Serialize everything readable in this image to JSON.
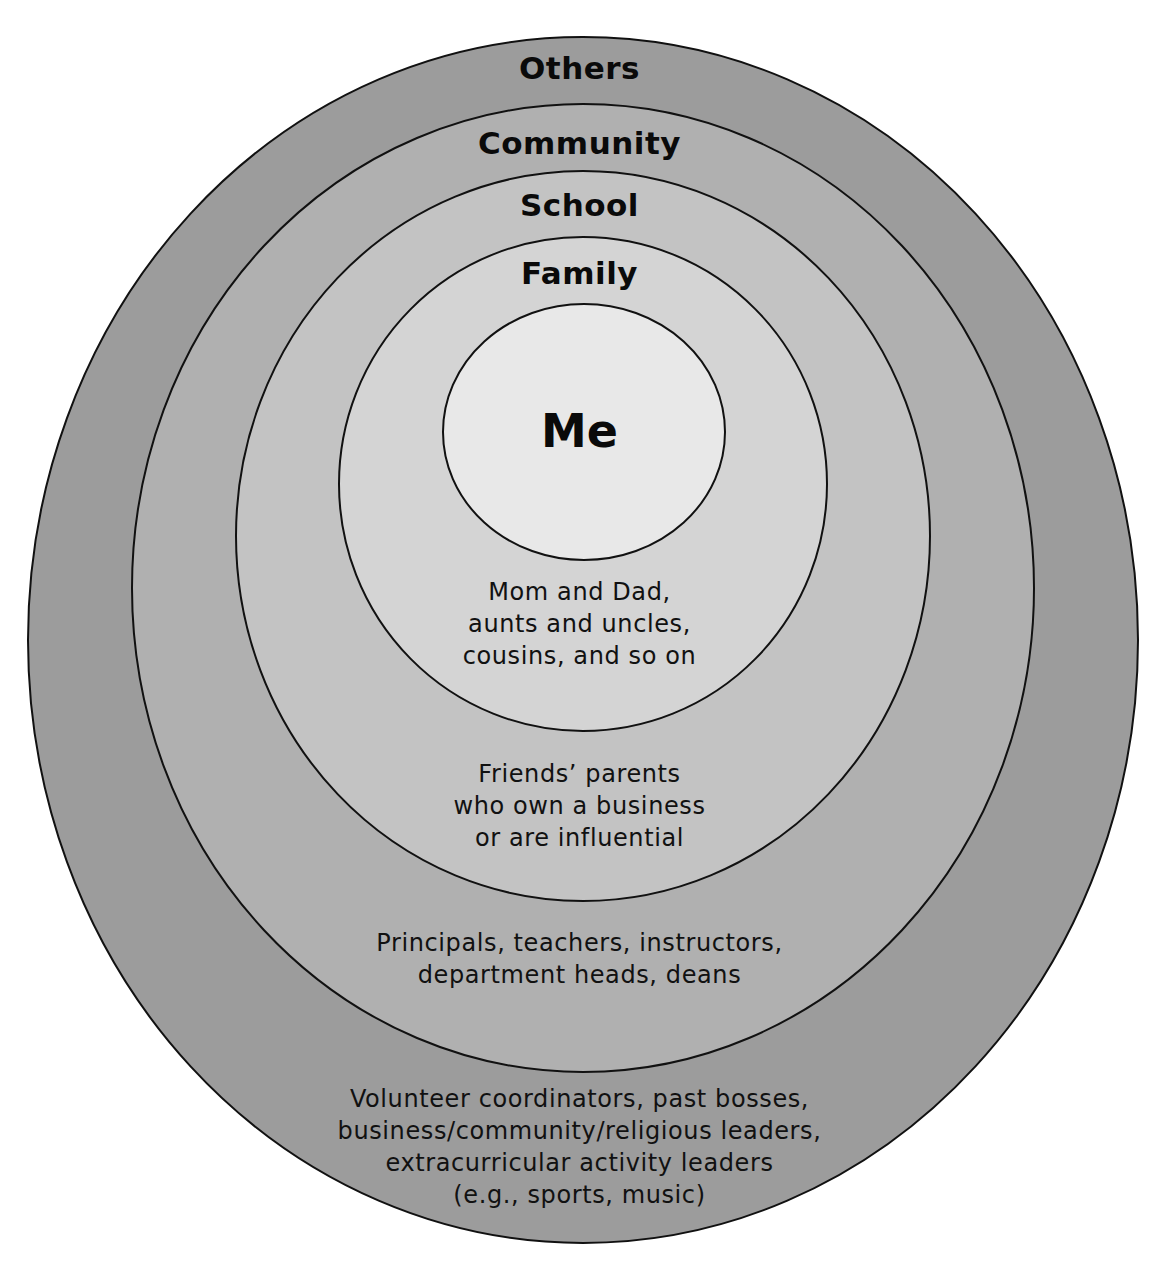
{
  "diagram": {
    "type": "concentric-circles",
    "rings": [
      {
        "id": "others",
        "title": "Others",
        "fill": "#9c9c9c",
        "description": [
          "Volunteer coordinators, past bosses,",
          "business/community/religious leaders,",
          "extracurricular activity leaders",
          "(e.g., sports, music)"
        ]
      },
      {
        "id": "community",
        "title": "Community",
        "fill": "#b0b0b0",
        "description": [
          "Principals, teachers, instructors,",
          "department heads, deans"
        ]
      },
      {
        "id": "school",
        "title": "School",
        "fill": "#c3c3c3",
        "description": [
          "Friends’ parents",
          "who own a business",
          "or are influential"
        ]
      },
      {
        "id": "family",
        "title": "Family",
        "fill": "#d4d4d4",
        "description": [
          "Mom and Dad,",
          "aunts and uncles,",
          "cousins, and so on"
        ]
      },
      {
        "id": "me",
        "title": "Me",
        "fill": "#e8e8e8"
      }
    ],
    "stroke_color": "#111111"
  }
}
